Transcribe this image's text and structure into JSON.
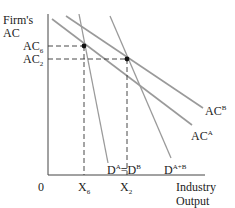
{
  "diagram": {
    "y_axis_label_line1": "Firm's",
    "y_axis_label_line2": "AC",
    "x_axis_label_line1": "Industry",
    "x_axis_label_line2": "Output",
    "origin_label": "0",
    "y_ticks": [
      {
        "base": "AC",
        "sub": "6",
        "y": 46
      },
      {
        "base": "AC",
        "sub": "2",
        "y": 59
      }
    ],
    "x_ticks": [
      {
        "base": "X",
        "sub": "6",
        "x": 84
      },
      {
        "base": "X",
        "sub": "2",
        "x": 127
      }
    ],
    "curves": [
      {
        "name": "AC",
        "sup": "B"
      },
      {
        "name": "AC",
        "sup": "A"
      },
      {
        "name": "D",
        "sup": "A+B"
      },
      {
        "name_left": "D",
        "sup_left": "A",
        "eq": "=",
        "name_right": "D",
        "sup_right": "B"
      }
    ],
    "colors": {
      "curve": "#9a9a9a",
      "axis": "#444444",
      "dash": "#333333",
      "point": "#111111"
    }
  }
}
